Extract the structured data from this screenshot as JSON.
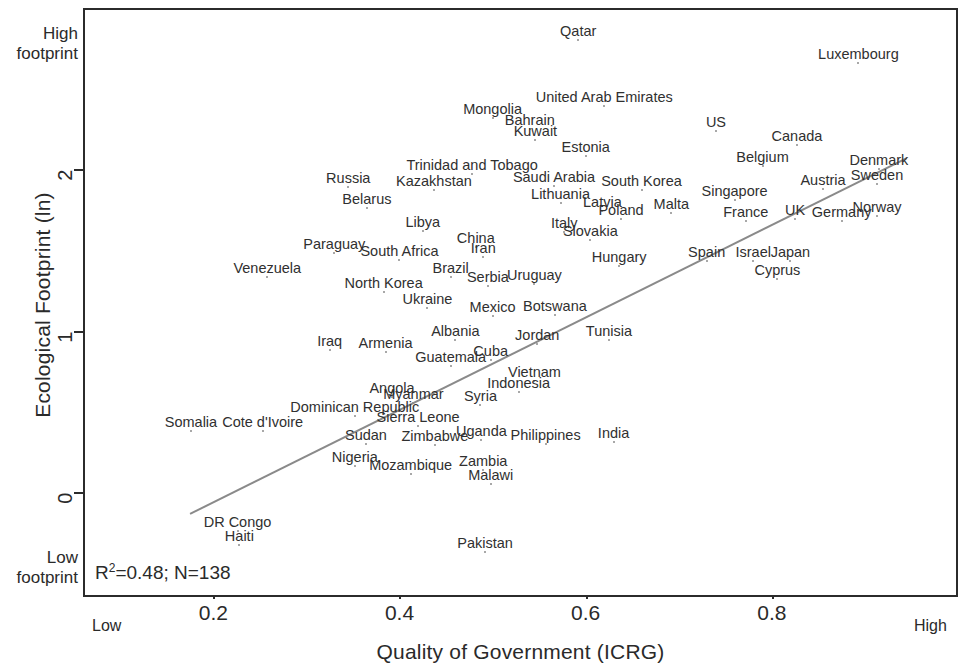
{
  "chart_data": {
    "type": "scatter",
    "title": "",
    "xlabel": "Quality of Government (ICRG)",
    "ylabel": "Ecological Footprint (ln)",
    "xlim": [
      0.06,
      1.0
    ],
    "ylim": [
      -0.65,
      3.0
    ],
    "xticks": [
      0.2,
      0.4,
      0.6,
      0.8
    ],
    "xtick_labels": [
      "0.2",
      "0.4",
      "0.6",
      "0.8"
    ],
    "yticks": [
      0,
      1,
      2
    ],
    "ytick_labels": [
      "0",
      "1",
      "2"
    ],
    "grid": false,
    "legend": null,
    "annotations": {
      "stats_r2": "0.48",
      "stats_n": "138",
      "stats_text": "R²=0.48; N=138",
      "y_axis_high": "High\nfootprint",
      "y_axis_high_line1": "High",
      "y_axis_high_line2": "footprint",
      "y_axis_low_line1": "Low",
      "y_axis_low_line2": "footprint",
      "x_axis_low": "Low",
      "x_axis_high": "High"
    },
    "trendline": {
      "type": "linear",
      "x_start": 0.175,
      "y_start": -0.135,
      "x_end": 0.945,
      "y_end": 2.07,
      "color": "#8a8a8a"
    },
    "point_color": "#8b8b8b",
    "points": [
      {
        "label": "Qatar",
        "x": 0.592,
        "y": 2.8
      },
      {
        "label": "Luxembourg",
        "x": 0.893,
        "y": 2.66
      },
      {
        "label": "United Arab Emirates",
        "x": 0.62,
        "y": 2.39
      },
      {
        "label": "Mongolia",
        "x": 0.5,
        "y": 2.32
      },
      {
        "label": "Bahrain",
        "x": 0.54,
        "y": 2.25
      },
      {
        "label": "US",
        "x": 0.74,
        "y": 2.24
      },
      {
        "label": "Kuwait",
        "x": 0.546,
        "y": 2.18
      },
      {
        "label": "Canada",
        "x": 0.827,
        "y": 2.15
      },
      {
        "label": "Estonia",
        "x": 0.6,
        "y": 2.08
      },
      {
        "label": "Belgium",
        "x": 0.79,
        "y": 2.02
      },
      {
        "label": "Denmark",
        "x": 0.915,
        "y": 2.0
      },
      {
        "label": "Trinidad and Tobago",
        "x": 0.478,
        "y": 1.97
      },
      {
        "label": "Saudi Arabia",
        "x": 0.566,
        "y": 1.9
      },
      {
        "label": "Sweden",
        "x": 0.913,
        "y": 1.91
      },
      {
        "label": "Austria",
        "x": 0.855,
        "y": 1.88
      },
      {
        "label": "Russia",
        "x": 0.345,
        "y": 1.89
      },
      {
        "label": "Kazakhstan",
        "x": 0.437,
        "y": 1.87
      },
      {
        "label": "South Korea",
        "x": 0.66,
        "y": 1.87
      },
      {
        "label": "Singapore",
        "x": 0.76,
        "y": 1.81
      },
      {
        "label": "Lithuania",
        "x": 0.573,
        "y": 1.79
      },
      {
        "label": "Belarus",
        "x": 0.365,
        "y": 1.76
      },
      {
        "label": "Latvia",
        "x": 0.618,
        "y": 1.74
      },
      {
        "label": "Malta",
        "x": 0.692,
        "y": 1.73
      },
      {
        "label": "Norway",
        "x": 0.913,
        "y": 1.71
      },
      {
        "label": "Poland",
        "x": 0.638,
        "y": 1.69
      },
      {
        "label": "France",
        "x": 0.772,
        "y": 1.68
      },
      {
        "label": "UK",
        "x": 0.825,
        "y": 1.69
      },
      {
        "label": "Germany",
        "x": 0.875,
        "y": 1.68
      },
      {
        "label": "Libya",
        "x": 0.425,
        "y": 1.62
      },
      {
        "label": "Italy",
        "x": 0.577,
        "y": 1.61
      },
      {
        "label": "Slovakia",
        "x": 0.605,
        "y": 1.56
      },
      {
        "label": "China",
        "x": 0.482,
        "y": 1.52
      },
      {
        "label": "Paraguay",
        "x": 0.33,
        "y": 1.48
      },
      {
        "label": "Iran",
        "x": 0.49,
        "y": 1.46
      },
      {
        "label": "South Africa",
        "x": 0.4,
        "y": 1.44
      },
      {
        "label": "Spain",
        "x": 0.73,
        "y": 1.43
      },
      {
        "label": "Israel",
        "x": 0.78,
        "y": 1.43
      },
      {
        "label": "Japan",
        "x": 0.82,
        "y": 1.43
      },
      {
        "label": "Hungary",
        "x": 0.636,
        "y": 1.4
      },
      {
        "label": "Venezuela",
        "x": 0.258,
        "y": 1.33
      },
      {
        "label": "Brazil",
        "x": 0.455,
        "y": 1.33
      },
      {
        "label": "Serbia",
        "x": 0.495,
        "y": 1.28
      },
      {
        "label": "Uruguay",
        "x": 0.545,
        "y": 1.29
      },
      {
        "label": "Cyprus",
        "x": 0.806,
        "y": 1.32
      },
      {
        "label": "North Korea",
        "x": 0.383,
        "y": 1.24
      },
      {
        "label": "Ukraine",
        "x": 0.43,
        "y": 1.14
      },
      {
        "label": "Mexico",
        "x": 0.5,
        "y": 1.09
      },
      {
        "label": "Botswana",
        "x": 0.567,
        "y": 1.1
      },
      {
        "label": "Albania",
        "x": 0.46,
        "y": 0.94
      },
      {
        "label": "Jordan",
        "x": 0.548,
        "y": 0.92
      },
      {
        "label": "Tunisia",
        "x": 0.625,
        "y": 0.94
      },
      {
        "label": "Iraq",
        "x": 0.325,
        "y": 0.88
      },
      {
        "label": "Armenia",
        "x": 0.385,
        "y": 0.87
      },
      {
        "label": "Cuba",
        "x": 0.498,
        "y": 0.82
      },
      {
        "label": "Guatemala",
        "x": 0.455,
        "y": 0.78
      },
      {
        "label": "Vietnam",
        "x": 0.545,
        "y": 0.69
      },
      {
        "label": "Indonesia",
        "x": 0.528,
        "y": 0.62
      },
      {
        "label": "Angola",
        "x": 0.392,
        "y": 0.59
      },
      {
        "label": "Myanmar",
        "x": 0.415,
        "y": 0.55
      },
      {
        "label": "Syria",
        "x": 0.487,
        "y": 0.54
      },
      {
        "label": "Dominican Republic",
        "x": 0.352,
        "y": 0.47
      },
      {
        "label": "Sierra Leone",
        "x": 0.42,
        "y": 0.41
      },
      {
        "label": "Somalia",
        "x": 0.176,
        "y": 0.38
      },
      {
        "label": "Cote d'Ivoire",
        "x": 0.253,
        "y": 0.38
      },
      {
        "label": "Uganda",
        "x": 0.488,
        "y": 0.32
      },
      {
        "label": "Sudan",
        "x": 0.364,
        "y": 0.3
      },
      {
        "label": "Zimbabwe",
        "x": 0.438,
        "y": 0.29
      },
      {
        "label": "Philippines",
        "x": 0.557,
        "y": 0.3
      },
      {
        "label": "India",
        "x": 0.63,
        "y": 0.31
      },
      {
        "label": "Nigeria",
        "x": 0.352,
        "y": 0.16
      },
      {
        "label": "Zambia",
        "x": 0.49,
        "y": 0.14
      },
      {
        "label": "Mozambique",
        "x": 0.412,
        "y": 0.11
      },
      {
        "label": "Malawi",
        "x": 0.498,
        "y": 0.05
      },
      {
        "label": "DR Congo",
        "x": 0.226,
        "y": -0.24
      },
      {
        "label": "Haiti",
        "x": 0.228,
        "y": -0.33
      },
      {
        "label": "Pakistan",
        "x": 0.492,
        "y": -0.37
      }
    ]
  }
}
